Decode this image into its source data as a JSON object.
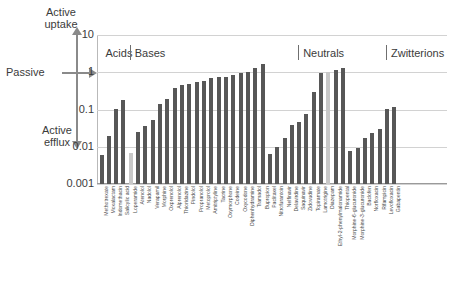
{
  "annotations": {
    "active_uptake": "Active\nuptake",
    "active_efflux": "Active\nefflux",
    "passive": "Passive"
  },
  "chart_data": {
    "type": "bar",
    "title": "",
    "xlabel": "",
    "ylabel": "",
    "yscale": "log",
    "ylim": [
      0.001,
      10
    ],
    "yticks": [
      "10",
      "1",
      "0.1",
      "0.01",
      "0.001"
    ],
    "grid": true,
    "legend": "none",
    "axis_annotations": [
      "Active uptake",
      "Passive",
      "Active efflux"
    ],
    "groups": [
      {
        "label": "Acids",
        "start_index": 0,
        "end_index": 3
      },
      {
        "label": "Bases",
        "start_index": 4,
        "end_index": 26
      },
      {
        "label": "Neutrals",
        "start_index": 27,
        "end_index": 38
      },
      {
        "label": "Zwitterions",
        "start_index": 39,
        "end_index": 45
      }
    ],
    "categories": [
      "Methotrexate",
      "Moxalactam",
      "Indomethacin",
      "Salicylic acid",
      "Loperamide",
      "Atenolol",
      "Nadolol",
      "Verapamil",
      "Morphine",
      "Oxprenolol",
      "Alprenolol",
      "Thioridazine",
      "Pindolol",
      "Propranolol",
      "Metoprolol",
      "Amitriptyline",
      "Tacrine",
      "Oxymorphone",
      "Codeine",
      "Oxycodone",
      "Diphenhydramine",
      "Tramadol",
      "Bupropion",
      "Paclitaxel",
      "Nitrofurantoin",
      "Nelfinavir",
      "Delavirdine",
      "Saquinavir",
      "Zidovudine",
      "Topiramate",
      "Lamotrigine",
      "Diazepam",
      "Ethyl-2-phenylmalonamide",
      "Thiopental",
      "Morphine-6-glucuronide",
      "Morphine-3-glucuronide",
      "Baclofen",
      "Norfloxacin",
      "Rifampicin",
      "Levofloxacin",
      "Gabapentin"
    ],
    "values": [
      0.006,
      0.019,
      0.105,
      0.185,
      0.007,
      0.025,
      0.036,
      0.051,
      0.145,
      0.195,
      0.37,
      0.45,
      0.49,
      0.56,
      0.6,
      0.7,
      0.74,
      0.76,
      0.83,
      0.93,
      0.99,
      1.3,
      1.7,
      0.0065,
      0.01,
      0.0175,
      0.039,
      0.047,
      0.078,
      0.29,
      0.93,
      0.99,
      1.12,
      1.3,
      0.0075,
      0.0095,
      0.017,
      0.024,
      0.03,
      0.103,
      0.115
    ],
    "highlighted": [
      "Loperamide",
      "Diazepam"
    ],
    "colors": {
      "bar": "#575757",
      "bar_highlight": "#c8c8c8",
      "grid": "#d2d2d2",
      "text": "#3b3b3b"
    }
  }
}
